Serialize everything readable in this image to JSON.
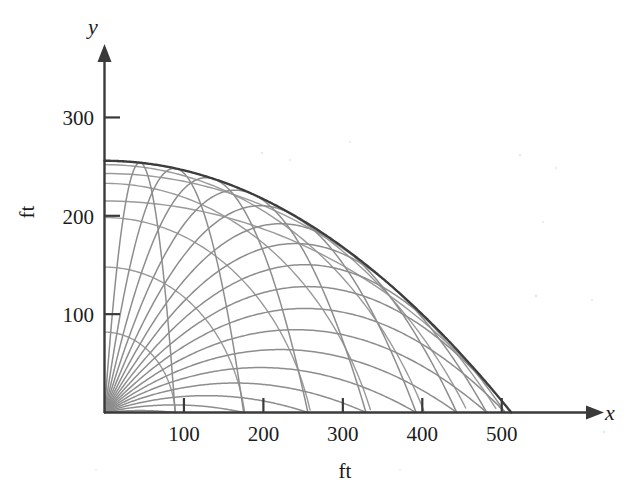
{
  "figure": {
    "title_visible": false,
    "background_color": "#ffffff"
  },
  "axes": {
    "x_axis": {
      "name": "x",
      "unit_label": "ft",
      "tick_labels": [
        "100",
        "200",
        "300",
        "400",
        "500"
      ],
      "tick_values": [
        100,
        200,
        300,
        400,
        500
      ],
      "range": [
        0,
        545
      ],
      "arrow": true,
      "color": "#3a3a3a"
    },
    "y_axis": {
      "name": "y",
      "unit_label": "ft",
      "tick_labels": [
        "100",
        "200",
        "300"
      ],
      "tick_values": [
        100,
        200,
        300
      ],
      "range": [
        0,
        345
      ],
      "arrow": true,
      "color": "#3a3a3a"
    }
  },
  "chart_data": {
    "type": "line",
    "title": "",
    "xlabel": "ft",
    "ylabel": "ft",
    "xlim": [
      0,
      545
    ],
    "ylim": [
      0,
      345
    ],
    "grid": false,
    "legend": "none",
    "x_tick_labels": [
      "100",
      "200",
      "300",
      "400",
      "500"
    ],
    "y_tick_labels": [
      "100",
      "200",
      "300"
    ],
    "x_axis_name": "x",
    "y_axis_name": "y",
    "physics": {
      "initial_speed_ft_per_s": 128,
      "gravity_ft_per_s2": 32,
      "max_range_ft": 512,
      "envelope_apex_ft": 256
    },
    "series": [
      {
        "name": "trajectory-05deg",
        "launch_angle_deg": 5,
        "range_ft": 88.9,
        "apex_ft": 3.9,
        "color": "#8d8d8d"
      },
      {
        "name": "trajectory-10deg",
        "launch_angle_deg": 10,
        "range_ft": 175.0,
        "apex_ft": 15.4,
        "color": "#8d8d8d"
      },
      {
        "name": "trajectory-15deg",
        "launch_angle_deg": 15,
        "range_ft": 256.0,
        "apex_ft": 34.3,
        "color": "#8d8d8d"
      },
      {
        "name": "trajectory-20deg",
        "launch_angle_deg": 20,
        "range_ft": 329.2,
        "apex_ft": 59.9,
        "color": "#8d8d8d"
      },
      {
        "name": "trajectory-25deg",
        "launch_angle_deg": 25,
        "range_ft": 392.3,
        "apex_ft": 91.4,
        "color": "#8d8d8d"
      },
      {
        "name": "trajectory-30deg",
        "launch_angle_deg": 30,
        "range_ft": 443.4,
        "apex_ft": 128.0,
        "color": "#8d8d8d"
      },
      {
        "name": "trajectory-35deg",
        "launch_angle_deg": 35,
        "range_ft": 481.2,
        "apex_ft": 168.5,
        "color": "#8d8d8d"
      },
      {
        "name": "trajectory-40deg",
        "launch_angle_deg": 40,
        "range_ft": 504.2,
        "apex_ft": 211.5,
        "color": "#8d8d8d"
      },
      {
        "name": "trajectory-45deg",
        "launch_angle_deg": 45,
        "range_ft": 512.0,
        "apex_ft": 256.0,
        "color": "#8d8d8d"
      },
      {
        "name": "trajectory-50deg",
        "launch_angle_deg": 50,
        "range_ft": 504.2,
        "apex_ft": 300.5,
        "color": "#8d8d8d"
      },
      {
        "name": "trajectory-55deg",
        "launch_angle_deg": 55,
        "range_ft": 481.2,
        "apex_ft": 343.5,
        "color": "#8d8d8d"
      },
      {
        "name": "trajectory-60deg",
        "launch_angle_deg": 60,
        "range_ft": 443.4,
        "apex_ft": 384.0,
        "color": "#8d8d8d"
      },
      {
        "name": "trajectory-65deg",
        "launch_angle_deg": 65,
        "range_ft": 392.3,
        "apex_ft": 420.6,
        "color": "#8d8d8d"
      },
      {
        "name": "trajectory-70deg",
        "launch_angle_deg": 70,
        "range_ft": 329.2,
        "apex_ft": 452.1,
        "color": "#8d8d8d"
      },
      {
        "name": "trajectory-75deg",
        "launch_angle_deg": 75,
        "range_ft": 256.0,
        "apex_ft": 477.7,
        "color": "#8d8d8d"
      },
      {
        "name": "trajectory-80deg",
        "launch_angle_deg": 80,
        "range_ft": 175.0,
        "apex_ft": 496.6,
        "color": "#8d8d8d"
      },
      {
        "name": "trajectory-85deg",
        "launch_angle_deg": 85,
        "range_ft": 88.9,
        "apex_ft": 508.1,
        "color": "#8d8d8d"
      }
    ],
    "isochrones": [
      {
        "name": "isochrone-t1",
        "time_s": 0.7,
        "radius_ft": 89.6,
        "drop_ft": 7.8,
        "color": "#9a9a9a"
      },
      {
        "name": "isochrone-t2",
        "time_s": 1.4,
        "radius_ft": 179.2,
        "drop_ft": 31.4,
        "color": "#9a9a9a"
      },
      {
        "name": "isochrone-t3",
        "time_s": 2.1,
        "radius_ft": 268.8,
        "drop_ft": 70.6,
        "color": "#9a9a9a"
      },
      {
        "name": "isochrone-t4",
        "time_s": 2.8,
        "radius_ft": 358.4,
        "drop_ft": 125.4,
        "color": "#9a9a9a"
      },
      {
        "name": "isochrone-t5",
        "time_s": 3.5,
        "radius_ft": 448.0,
        "drop_ft": 196.0,
        "color": "#9a9a9a"
      },
      {
        "name": "isochrone-t6",
        "time_s": 4.2,
        "radius_ft": 537.6,
        "drop_ft": 282.2,
        "color": "#9a9a9a"
      },
      {
        "name": "isochrone-t7",
        "time_s": 4.9,
        "radius_ft": 627.2,
        "drop_ft": 384.2,
        "color": "#9a9a9a"
      },
      {
        "name": "isochrone-t8",
        "time_s": 5.6,
        "radius_ft": 716.8,
        "drop_ft": 501.8,
        "color": "#9a9a9a"
      }
    ],
    "envelope": {
      "name": "safety-parabola-envelope",
      "apex_ft": 256,
      "x_intercept_ft": 512,
      "color": "#3d3d3d",
      "equation_note": "y = v^2/(2g) - g x^2/(2 v^2)"
    }
  }
}
